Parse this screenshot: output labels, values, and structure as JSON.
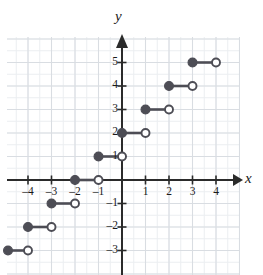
{
  "figure": {
    "name": "step-function-graph",
    "axis_label_x": "x",
    "axis_label_y": "y"
  },
  "colors": {
    "point": "#4d4d55",
    "line": "#4d4d55",
    "open_fill": "#ffffff",
    "axis": "#2b2b2b",
    "grid_major": "#d9dde2",
    "grid_minor": "#ebeef1",
    "text": "#1a1a1a"
  },
  "chart_data": {
    "type": "line",
    "title": "",
    "xlabel": "x",
    "ylabel": "y",
    "xlim": [
      -5.0,
      5.1
    ],
    "ylim": [
      -3.9,
      6.1
    ],
    "grid": true,
    "legend": false,
    "x_ticks": [
      -4,
      -3,
      -2,
      -1,
      1,
      2,
      3,
      4
    ],
    "x_tick_labels": [
      "–4",
      "–3",
      "–2",
      "–1",
      "1",
      "2",
      "3",
      "4"
    ],
    "y_ticks": [
      -3,
      -2,
      -1,
      1,
      2,
      3,
      4,
      5
    ],
    "y_tick_labels": [
      "–3",
      "–2",
      "–1",
      "1",
      "2",
      "3",
      "4",
      "5"
    ],
    "segments": [
      {
        "y": -3,
        "x_start": -5,
        "x_end": -4,
        "left_endpoint": "closed",
        "right_endpoint": "open"
      },
      {
        "y": -2,
        "x_start": -4,
        "x_end": -3,
        "left_endpoint": "closed",
        "right_endpoint": "open"
      },
      {
        "y": -1,
        "x_start": -3,
        "x_end": -2,
        "left_endpoint": "closed",
        "right_endpoint": "open"
      },
      {
        "y": 0,
        "x_start": -2,
        "x_end": -1,
        "left_endpoint": "closed",
        "right_endpoint": "open"
      },
      {
        "y": 1,
        "x_start": -1,
        "x_end": 0,
        "left_endpoint": "closed",
        "right_endpoint": "open"
      },
      {
        "y": 2,
        "x_start": 0,
        "x_end": 1,
        "left_endpoint": "closed",
        "right_endpoint": "open"
      },
      {
        "y": 3,
        "x_start": 1,
        "x_end": 2,
        "left_endpoint": "closed",
        "right_endpoint": "open"
      },
      {
        "y": 4,
        "x_start": 2,
        "x_end": 3,
        "left_endpoint": "closed",
        "right_endpoint": "open"
      },
      {
        "y": 5,
        "x_start": 3,
        "x_end": 4,
        "left_endpoint": "closed",
        "right_endpoint": "open"
      }
    ]
  }
}
